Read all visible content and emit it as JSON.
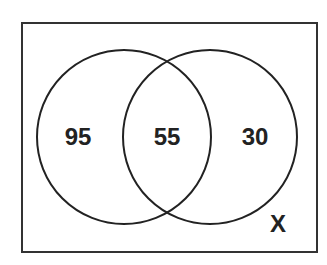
{
  "diagram": {
    "type": "venn",
    "universe_label": "X",
    "regions": {
      "left_only": "95",
      "intersection": "55",
      "right_only": "30"
    },
    "colors": {
      "stroke": "#222222",
      "background": "#ffffff"
    }
  }
}
